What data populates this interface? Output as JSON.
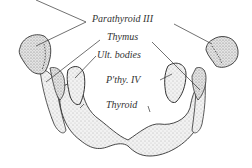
{
  "figure": {
    "labels": {
      "parathyroid_iii": "Parathyroid III",
      "thymus": "Thymus",
      "ult_bodies": "Ult. bodies",
      "pthy_iv": "P'thy. IV",
      "thyroid": "Thyroid"
    },
    "colors": {
      "ink": "#333333",
      "fill": "#e6e6e6",
      "background": "#ffffff"
    }
  }
}
